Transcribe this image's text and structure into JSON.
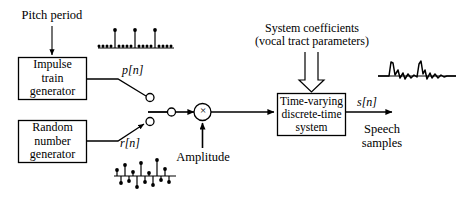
{
  "diagram": {
    "line_color": "#000000",
    "background": "#ffffff"
  },
  "blocks": [
    {
      "id": "impulse-train-generator",
      "lines": [
        "Impulse",
        "train",
        "generator"
      ]
    },
    {
      "id": "random-number-generator",
      "lines": [
        "Random",
        "number",
        "generator"
      ]
    },
    {
      "id": "time-varying-system",
      "lines": [
        "Time-varying",
        "discrete-time",
        "system"
      ]
    }
  ],
  "labels": {
    "pitch_period": "Pitch period",
    "system_coefficients_line1": "System coefficients",
    "system_coefficients_line2": "(vocal tract parameters)",
    "amplitude": "Amplitude",
    "speech_line1": "Speech",
    "speech_line2": "samples",
    "p_of_n": "p[n]",
    "r_of_n": "r[n]",
    "s_of_n": "s[n]",
    "multiplier_symbol": "×"
  },
  "waveforms": {
    "impulse_train": {
      "type": "stem",
      "caption": "periodic impulse train p[n]",
      "baseline_y": 48,
      "x_start": 98,
      "x_end": 174,
      "samples": [
        {
          "x": 99,
          "h": 2
        },
        {
          "x": 103,
          "h": 2
        },
        {
          "x": 107,
          "h": 2
        },
        {
          "x": 111,
          "h": 2
        },
        {
          "x": 115,
          "h": 18
        },
        {
          "x": 119,
          "h": 2
        },
        {
          "x": 123,
          "h": 2
        },
        {
          "x": 127,
          "h": 2
        },
        {
          "x": 131,
          "h": 2
        },
        {
          "x": 135,
          "h": 18
        },
        {
          "x": 139,
          "h": 2
        },
        {
          "x": 143,
          "h": 2
        },
        {
          "x": 147,
          "h": 2
        },
        {
          "x": 151,
          "h": 2
        },
        {
          "x": 155,
          "h": 18
        },
        {
          "x": 159,
          "h": 2
        },
        {
          "x": 163,
          "h": 2
        },
        {
          "x": 167,
          "h": 2
        },
        {
          "x": 171,
          "h": 2
        }
      ]
    },
    "random_noise": {
      "type": "stem-bipolar",
      "caption": "random noise r[n]",
      "baseline_y": 176,
      "x_start": 114,
      "x_end": 176,
      "samples": [
        {
          "x": 117,
          "h": 6
        },
        {
          "x": 121,
          "h": -7
        },
        {
          "x": 125,
          "h": 11
        },
        {
          "x": 129,
          "h": -5
        },
        {
          "x": 133,
          "h": 4
        },
        {
          "x": 137,
          "h": -11
        },
        {
          "x": 141,
          "h": 13
        },
        {
          "x": 145,
          "h": -6
        },
        {
          "x": 149,
          "h": 3
        },
        {
          "x": 153,
          "h": -9
        },
        {
          "x": 157,
          "h": 16
        },
        {
          "x": 161,
          "h": -4
        },
        {
          "x": 165,
          "h": 7
        },
        {
          "x": 169,
          "h": -6
        }
      ]
    },
    "speech_signal": {
      "type": "line",
      "caption": "speech samples s[n]",
      "baseline_y": 76,
      "x_start": 378,
      "x_end": 456,
      "points": "378,76 385,76 389,76 391,62 393,63 395,75 398,70 400,78 403,73 405,79 408,74 411,78 414,75 417,77 419,64 421,61 423,74 425,70 427,79 430,73 432,78 435,74 438,78 441,75 444,77 447,76 451,76 456,76"
    }
  },
  "connections": [
    {
      "from": "pitch-period-label",
      "to": "impulse-train-generator",
      "style": "solid-arrow"
    },
    {
      "from": "impulse-train-generator",
      "to": "switch-terminal-upper",
      "style": "solid-arrow",
      "label": "p[n]"
    },
    {
      "from": "random-number-generator",
      "to": "switch-terminal-lower",
      "style": "solid-arrow",
      "label": "r[n]"
    },
    {
      "from": "switch-wiper",
      "to": "multiplier",
      "style": "solid-arrow"
    },
    {
      "from": "amplitude-label",
      "to": "multiplier",
      "style": "solid-arrow"
    },
    {
      "from": "multiplier",
      "to": "time-varying-system",
      "style": "solid-arrow"
    },
    {
      "from": "system-coefficients-label",
      "to": "time-varying-system",
      "style": "hollow-arrow"
    },
    {
      "from": "time-varying-system",
      "to": "speech-output",
      "style": "solid-arrow",
      "label": "s[n]"
    }
  ]
}
